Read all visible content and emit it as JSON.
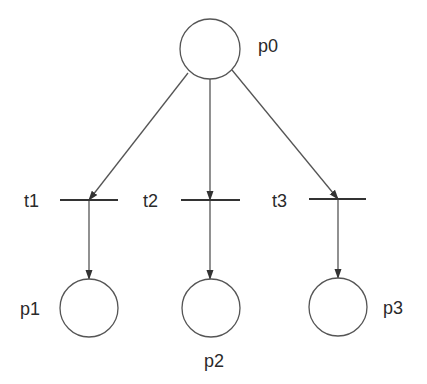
{
  "diagram": {
    "type": "petri-net",
    "stroke_color": "#555555",
    "places": [
      {
        "id": "p0",
        "label": "p0",
        "cx": 210,
        "cy": 49,
        "r": 30,
        "label_x": 258,
        "label_y": 52
      },
      {
        "id": "p1",
        "label": "p1",
        "cx": 89,
        "cy": 308,
        "r": 29,
        "label_x": 20,
        "label_y": 315
      },
      {
        "id": "p2",
        "label": "p2",
        "cx": 211,
        "cy": 308,
        "r": 29,
        "label_x": 204,
        "label_y": 367
      },
      {
        "id": "p3",
        "label": "p3",
        "cx": 338,
        "cy": 307,
        "r": 29,
        "label_x": 383,
        "label_y": 314
      }
    ],
    "transitions": [
      {
        "id": "t1",
        "label": "t1",
        "x1": 60,
        "x2": 118,
        "y": 200,
        "label_x": 24,
        "label_y": 207
      },
      {
        "id": "t2",
        "label": "t2",
        "x1": 181,
        "x2": 240,
        "y": 200,
        "label_x": 143,
        "label_y": 207
      },
      {
        "id": "t3",
        "label": "t3",
        "x1": 309,
        "x2": 366,
        "y": 199,
        "label_x": 272,
        "label_y": 207
      }
    ],
    "arcs": [
      {
        "from": "p0",
        "to": "t1",
        "x1": 188,
        "y1": 73,
        "x2": 89,
        "y2": 200
      },
      {
        "from": "p0",
        "to": "t2",
        "x1": 210,
        "y1": 79,
        "x2": 210,
        "y2": 200
      },
      {
        "from": "p0",
        "to": "t3",
        "x1": 232,
        "y1": 70,
        "x2": 338,
        "y2": 199
      },
      {
        "from": "t1",
        "to": "p1",
        "x1": 89,
        "y1": 200,
        "x2": 89,
        "y2": 279
      },
      {
        "from": "t2",
        "to": "p2",
        "x1": 210,
        "y1": 200,
        "x2": 210,
        "y2": 279
      },
      {
        "from": "t3",
        "to": "p3",
        "x1": 338,
        "y1": 199,
        "x2": 338,
        "y2": 278
      }
    ]
  }
}
